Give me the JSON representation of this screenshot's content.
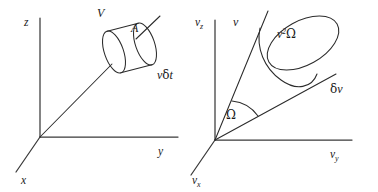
{
  "figure": {
    "type": "physics-diagram",
    "background_color": "#ffffff",
    "line_color": "#2b2b2b"
  },
  "left_panel": {
    "name": "position-space-cylinder",
    "axes": {
      "z_label": "z",
      "y_label": "y",
      "x_label": "x"
    },
    "annotations": {
      "volume_label": "V",
      "area_label": "A",
      "length_label_v": "v",
      "length_label_delta": "δ",
      "length_label_t": "t"
    }
  },
  "right_panel": {
    "name": "velocity-space-cone",
    "axes": {
      "vz_label": "v",
      "vz_sub": "z",
      "vy_label": "v",
      "vy_sub": "y",
      "vx_label": "v",
      "vx_sub": "x"
    },
    "annotations": {
      "speed_label": "v",
      "cap_area_label_v": "v",
      "cap_area_sup": "2",
      "cap_area_omega": "Ω",
      "thickness_label_delta": "δ",
      "thickness_label_v": "v",
      "solid_angle_label": "Ω"
    }
  }
}
